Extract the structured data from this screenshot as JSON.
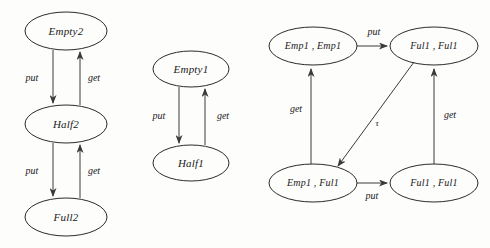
{
  "figure": {
    "background_color": "#fdfdfc",
    "stroke_color": "#2b2b2b",
    "text_color": "#1a1a1a"
  },
  "diagrams": [
    {
      "id": "diagram-left",
      "name": "two-place-buffer",
      "nodes": [
        {
          "id": "empty2",
          "label": "Empty2",
          "cx": 66,
          "cy": 31,
          "rx": 41,
          "ry": 19
        },
        {
          "id": "half2",
          "label": "Half2",
          "cx": 66,
          "cy": 124,
          "rx": 41,
          "ry": 19
        },
        {
          "id": "full2",
          "label": "Full2",
          "cx": 66,
          "cy": 217,
          "rx": 41,
          "ry": 19
        }
      ],
      "edges": [
        {
          "id": "e-l1",
          "from": "empty2",
          "to": "half2",
          "label": "put",
          "label_x": 32,
          "label_y": 79
        },
        {
          "id": "e-l2",
          "from": "half2",
          "to": "empty2",
          "label": "get",
          "label_x": 94,
          "label_y": 79
        },
        {
          "id": "e-l3",
          "from": "half2",
          "to": "full2",
          "label": "put",
          "label_x": 32,
          "label_y": 172
        },
        {
          "id": "e-l4",
          "from": "full2",
          "to": "half2",
          "label": "get",
          "label_x": 94,
          "label_y": 172
        }
      ]
    },
    {
      "id": "diagram-middle",
      "name": "one-place-buffer",
      "nodes": [
        {
          "id": "empty1",
          "label": "Empty1",
          "cx": 191,
          "cy": 69,
          "rx": 38,
          "ry": 18
        },
        {
          "id": "half1",
          "label": "Half1",
          "cx": 191,
          "cy": 163,
          "rx": 38,
          "ry": 18
        }
      ],
      "edges": [
        {
          "id": "e-m1",
          "from": "empty1",
          "to": "half1",
          "label": "put",
          "label_x": 159,
          "label_y": 117
        },
        {
          "id": "e-m2",
          "from": "half1",
          "to": "empty1",
          "label": "get",
          "label_x": 223,
          "label_y": 117
        }
      ]
    },
    {
      "id": "diagram-right",
      "name": "composed-buffer-product",
      "nodes": [
        {
          "id": "emp-emp",
          "label": "Emp1 , Emp1",
          "cx": 313,
          "cy": 46,
          "rx": 44,
          "ry": 19
        },
        {
          "id": "ful-ful-top",
          "label": "Ful1 , Ful1",
          "cx": 434,
          "cy": 46,
          "rx": 44,
          "ry": 19
        },
        {
          "id": "emp-ful",
          "label": "Emp1 , Ful1",
          "cx": 313,
          "cy": 183,
          "rx": 44,
          "ry": 19
        },
        {
          "id": "ful-ful-bot",
          "label": "Ful1 , Ful1",
          "cx": 434,
          "cy": 183,
          "rx": 44,
          "ry": 19
        }
      ],
      "edges": [
        {
          "id": "e-r1",
          "from": "emp-emp",
          "to": "ful-ful-top",
          "label": "put",
          "label_x": 374,
          "label_y": 33
        },
        {
          "id": "e-r2",
          "from": "emp-ful",
          "to": "emp-emp",
          "label": "get",
          "label_x": 296,
          "label_y": 110
        },
        {
          "id": "e-r3",
          "from": "ful-ful-top",
          "to": "emp-ful",
          "label": "τ",
          "label_x": 377,
          "label_y": 124
        },
        {
          "id": "e-r4",
          "from": "emp-ful",
          "to": "ful-ful-bot",
          "label": "put",
          "label_x": 372,
          "label_y": 197
        },
        {
          "id": "e-r5",
          "from": "ful-ful-bot",
          "to": "ful-ful-top",
          "label": "get",
          "label_x": 450,
          "label_y": 116
        }
      ]
    }
  ]
}
